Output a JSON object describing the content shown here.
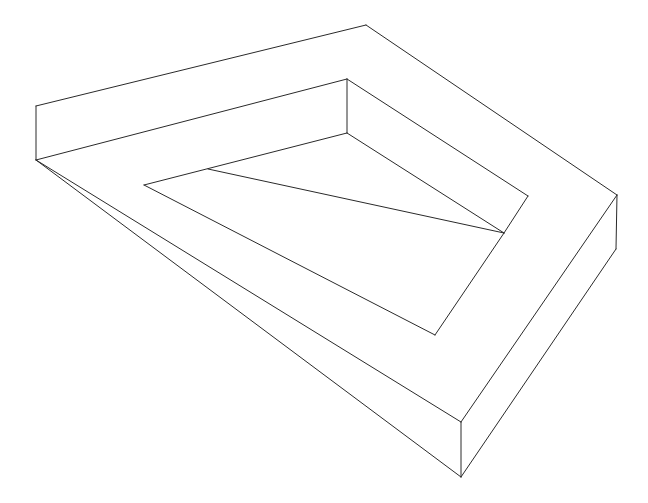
{
  "figure": {
    "stroke_color": "#2a2a2a",
    "background_color": "#ffffff",
    "segments": [
      [
        36,
        106,
        366,
        25
      ],
      [
        366,
        25,
        617,
        195
      ],
      [
        617,
        195,
        616,
        249
      ],
      [
        616,
        249,
        461,
        477
      ],
      [
        461,
        477,
        461,
        422
      ],
      [
        461,
        422,
        617,
        195
      ],
      [
        461,
        477,
        36,
        160
      ],
      [
        36,
        160,
        36,
        106
      ],
      [
        36,
        160,
        347,
        79
      ],
      [
        347,
        79,
        347,
        133
      ],
      [
        347,
        79,
        528,
        196
      ],
      [
        528,
        196,
        504,
        233
      ],
      [
        347,
        133,
        144,
        185
      ],
      [
        144,
        185,
        435,
        335
      ],
      [
        435,
        335,
        504,
        233
      ],
      [
        347,
        133,
        504,
        233
      ],
      [
        208,
        169,
        504,
        233
      ],
      [
        36,
        160,
        461,
        422
      ]
    ]
  }
}
